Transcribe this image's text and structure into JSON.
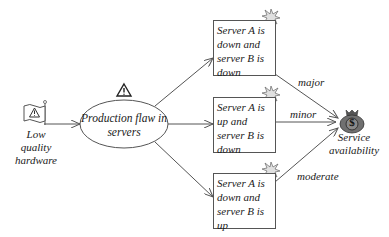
{
  "diagram": {
    "source_node": {
      "label_lines": [
        "Low",
        "quality",
        "hardware"
      ],
      "icon": "warning-flag-icon"
    },
    "hazard_node": {
      "label_lines": [
        "Production flaw in",
        "servers"
      ],
      "icon": "warning-triangle-icon"
    },
    "scenario_nodes": [
      {
        "label_lines": [
          "Server A is",
          "down and",
          "server B is",
          "down"
        ],
        "icon": "explosion-icon"
      },
      {
        "label_lines": [
          "Server A is",
          "up and",
          "server B is",
          "down"
        ],
        "icon": "explosion-icon"
      },
      {
        "label_lines": [
          "Server A is",
          "down and",
          "server B is",
          "up"
        ],
        "icon": "explosion-icon"
      }
    ],
    "target_node": {
      "label_lines": [
        "Service",
        "availability"
      ],
      "icon": "money-bag-icon",
      "icon_glyph": "$"
    },
    "edges": [
      {
        "from": "source_node",
        "to": "hazard_node",
        "label": ""
      },
      {
        "from": "hazard_node",
        "to": "scenario_0",
        "label": ""
      },
      {
        "from": "hazard_node",
        "to": "scenario_1",
        "label": ""
      },
      {
        "from": "hazard_node",
        "to": "scenario_2",
        "label": ""
      },
      {
        "from": "scenario_0",
        "to": "target_node",
        "label": "major"
      },
      {
        "from": "scenario_1",
        "to": "target_node",
        "label": "minor"
      },
      {
        "from": "scenario_2",
        "to": "target_node",
        "label": "moderate"
      }
    ],
    "colors": {
      "line": "#555555",
      "text": "#1a1a1a",
      "money_bag": "#707070",
      "explosion": "#d8d8d8"
    }
  }
}
